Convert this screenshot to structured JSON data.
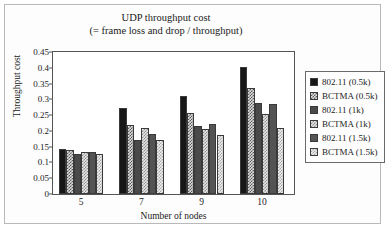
{
  "chart_data": {
    "type": "bar",
    "title": "UDP throughput cost",
    "subtitle": "(= frame loss and drop / throughput)",
    "xlabel": "Number of nodes",
    "ylabel": "Throughput cost",
    "categories": [
      "5",
      "7",
      "9",
      "10"
    ],
    "ylim": [
      0,
      0.45
    ],
    "ytick_labels": [
      "0",
      "0.05",
      "0.1",
      "0.15",
      "0.2",
      "0.25",
      "0.3",
      "0.35",
      "0.4",
      "0.45"
    ],
    "ytick_values": [
      0,
      0.05,
      0.1,
      0.15,
      0.2,
      0.25,
      0.3,
      0.35,
      0.4,
      0.45
    ],
    "grid": false,
    "legend_position": "right-outside",
    "series": [
      {
        "name": "802.11 (0.5k)",
        "values": [
          0.143,
          0.273,
          0.31,
          0.401
        ]
      },
      {
        "name": "BCTMA (0.5k)",
        "values": [
          0.138,
          0.219,
          0.256,
          0.337
        ]
      },
      {
        "name": "802.11 (1k)",
        "values": [
          0.127,
          0.172,
          0.217,
          0.287
        ]
      },
      {
        "name": "BCTMA (1k)",
        "values": [
          0.133,
          0.21,
          0.206,
          0.255
        ]
      },
      {
        "name": "802.11 (1.5k)",
        "values": [
          0.133,
          0.189,
          0.221,
          0.284
        ]
      },
      {
        "name": "BCTMA (1.5k)",
        "values": [
          0.126,
          0.172,
          0.187,
          0.208
        ]
      }
    ]
  },
  "legend": {
    "items": [
      {
        "label": "802.11 (0.5k)"
      },
      {
        "label": "BCTMA (0.5k)"
      },
      {
        "label": "802.11 (1k)"
      },
      {
        "label": "BCTMA (1k)"
      },
      {
        "label": "802.11 (1.5k)"
      },
      {
        "label": "BCTMA (1.5k)"
      }
    ]
  }
}
